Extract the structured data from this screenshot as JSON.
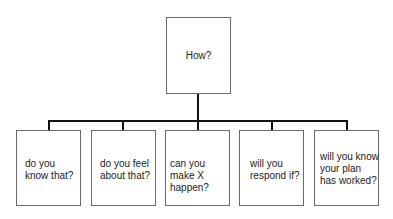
{
  "diagram": {
    "root": {
      "label": "How?"
    },
    "children": [
      {
        "label": "do you know that?"
      },
      {
        "label": "do you feel about that?"
      },
      {
        "label": "can you make X happen?"
      },
      {
        "label": "will you respond if?"
      },
      {
        "label": "will you know your plan has worked?"
      }
    ]
  }
}
